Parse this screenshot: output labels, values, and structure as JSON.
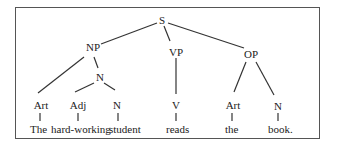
{
  "diagram": {
    "type": "syntax-tree",
    "nodes": {
      "s": "S",
      "np": "NP",
      "vp": "VP",
      "op": "OP",
      "n_inner": "N",
      "art1": "Art",
      "adj": "Adj",
      "n1": "N",
      "v": "V",
      "art2": "Art",
      "n2": "N"
    },
    "words": {
      "w1": "The",
      "w2": "hard-working",
      "w3": "student",
      "w4": "reads",
      "w5": "the",
      "w6": "book."
    },
    "colors": {
      "line": "#333333",
      "text": "#222222",
      "frame": "#555555"
    }
  }
}
